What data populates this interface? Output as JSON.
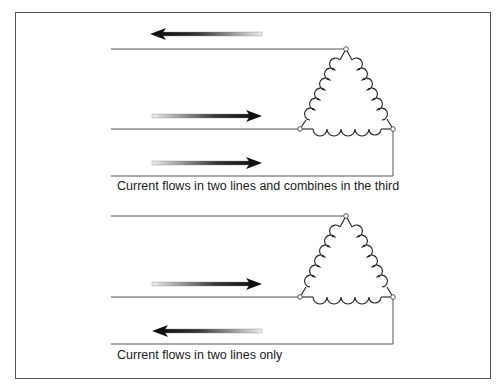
{
  "figure": {
    "panels": [
      {
        "caption": "Current flows in two lines and combines in the third",
        "lines": [
          {
            "y": 49,
            "arrow_direction": "left"
          },
          {
            "y": 129,
            "arrow_direction": "right"
          },
          {
            "y": 176,
            "arrow_direction": "right"
          }
        ],
        "component": "delta-connected-coil-winding"
      },
      {
        "caption": "Current flows in two lines only",
        "lines": [
          {
            "y": 216,
            "arrow_direction": "none"
          },
          {
            "y": 297,
            "arrow_direction": "right"
          },
          {
            "y": 344,
            "arrow_direction": "left"
          }
        ],
        "component": "delta-connected-coil-winding"
      }
    ],
    "colors": {
      "line": "#555555",
      "arrow_dark": "#111111",
      "arrow_light": "#e6e6e6",
      "border": "#555555"
    }
  }
}
